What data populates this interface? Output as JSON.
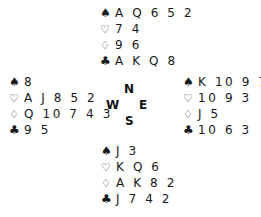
{
  "suits": {
    "spades": "♠",
    "hearts": "♡",
    "diamonds": "♢",
    "clubs": "♣"
  },
  "hands": {
    "north": {
      "spades": "A Q 6 5 2",
      "hearts": "7 4",
      "diamonds": "9 6",
      "clubs": "A K Q 8"
    },
    "west": {
      "spades": "8",
      "hearts": "A J 8 5 2",
      "diamonds": "Q 10 7 4 3",
      "clubs": "9 5"
    },
    "east": {
      "spades": "K 10 9 7 4",
      "hearts": "10 9 3",
      "diamonds": "J 5",
      "clubs": "10 6 3"
    },
    "south": {
      "spades": "J 3",
      "hearts": "K Q 6",
      "diamonds": "A K 8 2",
      "clubs": "J 7 4 2"
    }
  },
  "compass": {
    "north": "N",
    "west": "W",
    "east": "E",
    "south": "S"
  }
}
